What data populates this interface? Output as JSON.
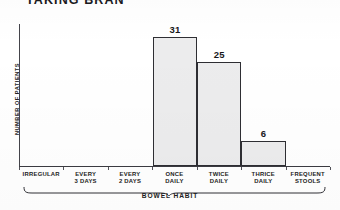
{
  "chart_data": {
    "type": "bar",
    "title": "TAKING BRAN",
    "xlabel": "BOWEL HABIT",
    "ylabel": "NUMBER OF PATIENTS",
    "categories": [
      "IRREGULAR",
      "EVERY\n3 DAYS",
      "EVERY\n2 DAYS",
      "ONCE\nDAILY",
      "TWICE\nDAILY",
      "THRICE\nDAILY",
      "FREQUENT\nSTOOLS"
    ],
    "values": [
      0,
      0,
      0,
      31,
      25,
      6,
      0
    ],
    "value_labels": [
      "",
      "",
      "",
      "31",
      "25",
      "6",
      ""
    ],
    "ylim": [
      0,
      34
    ],
    "grid": false,
    "legend": false,
    "bar_style": {
      "fill": "crosshatch",
      "fill_color": "#ececed",
      "hatch_color": "#46464e",
      "border_color": "#2e2e33"
    }
  },
  "axis": {
    "y_tick_labels": [],
    "x_tick_labels": [
      "IRREGULAR",
      "EVERY 3 DAYS",
      "EVERY 2 DAYS",
      "ONCE DAILY",
      "TWICE DAILY",
      "THRICE DAILY",
      "FREQUENT STOOLS"
    ]
  },
  "cats": [
    {
      "l1": "IRREGULAR",
      "l2": ""
    },
    {
      "l1": "EVERY",
      "l2": "3 DAYS"
    },
    {
      "l1": "EVERY",
      "l2": "2 DAYS"
    },
    {
      "l1": "ONCE",
      "l2": "DAILY"
    },
    {
      "l1": "TWICE",
      "l2": "DAILY"
    },
    {
      "l1": "THRICE",
      "l2": "DAILY"
    },
    {
      "l1": "FREQUENT",
      "l2": "STOOLS"
    }
  ]
}
